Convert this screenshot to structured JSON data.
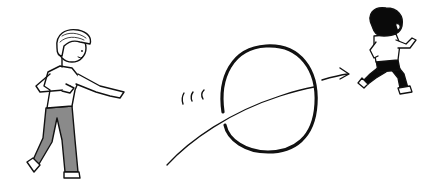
{
  "scene": {
    "description": "Child throws a ring that flies through the air toward another child running away",
    "colors": {
      "background": "#ffffff",
      "ink": "#111111",
      "pants": "#8a8a8a",
      "hair_runner": "#0a0a0a"
    },
    "elements": {
      "thrower": "child-throwing",
      "ring": "flying-ring",
      "trajectory": "throw-arc",
      "motion_lines": "motion-lines",
      "arrow": "direction-arrow",
      "runner": "child-running"
    }
  }
}
